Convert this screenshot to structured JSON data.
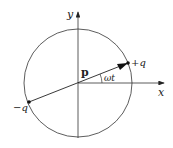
{
  "diagram": {
    "labels": {
      "x_axis": "x",
      "y_axis": "y",
      "dipole": "p",
      "angle": "ωt",
      "positive_charge": "+q",
      "negative_charge": "−q"
    },
    "colors": {
      "stroke": "#333333",
      "background": "#ffffff"
    }
  }
}
